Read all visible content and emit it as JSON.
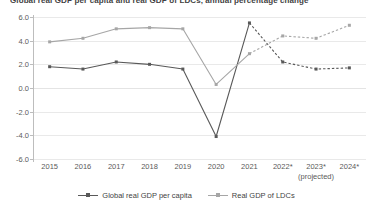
{
  "chart_data": {
    "type": "line",
    "title": "Global real GDP per capita and real GDP of LDCs, annual percentage change",
    "xlabel": "",
    "ylabel": "",
    "grid": true,
    "legend_position": "bottom",
    "ylim": [
      -6.0,
      6.0
    ],
    "ytick_labels": [
      "6.0",
      "4.0",
      "2.0",
      "0.0",
      "-2.0",
      "-4.0",
      "-6.0"
    ],
    "ytick_values": [
      6.0,
      4.0,
      2.0,
      0.0,
      -2.0,
      -4.0,
      -6.0
    ],
    "categories": [
      "2015",
      "2016",
      "2017",
      "2018",
      "2019",
      "2020",
      "2021",
      "2022*",
      "2023*",
      "2024*"
    ],
    "projected_note": "(projected)",
    "projection_start_index": 6,
    "series": [
      {
        "name": "Global real GDP per capita",
        "color": "#595959",
        "style": "solid",
        "values": [
          1.8,
          1.6,
          2.2,
          2.0,
          1.6,
          -4.1,
          5.5,
          2.2,
          1.6,
          1.7
        ]
      },
      {
        "name": "Real GDP of LDCs",
        "color": "#a6a6a6",
        "style": "solid",
        "values": [
          3.9,
          4.2,
          5.0,
          5.1,
          5.0,
          0.3,
          2.9,
          4.4,
          4.2,
          5.3
        ]
      }
    ]
  },
  "legend": {
    "items": [
      {
        "label": "Global real GDP per capita"
      },
      {
        "label": "Real GDP of LDCs"
      }
    ]
  }
}
